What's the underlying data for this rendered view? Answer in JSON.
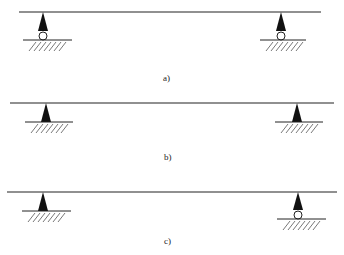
{
  "figure": {
    "panels": [
      {
        "label": "a)",
        "beam": {
          "y": 12,
          "x1": 19,
          "x2": 321
        },
        "supports": [
          {
            "type": "roller",
            "x": 43,
            "ground_y": 40,
            "ground_x1": 23,
            "ground_x2": 72
          },
          {
            "type": "roller",
            "x": 281,
            "ground_y": 40,
            "ground_x1": 260,
            "ground_x2": 306
          }
        ],
        "label_pos": {
          "x": 163,
          "y": 73
        }
      },
      {
        "label": "b)",
        "beam": {
          "y": 103,
          "x1": 10,
          "x2": 334
        },
        "supports": [
          {
            "type": "pin",
            "x": 46,
            "ground_y": 122,
            "ground_x1": 25,
            "ground_x2": 73
          },
          {
            "type": "pin",
            "x": 297,
            "ground_y": 122,
            "ground_x1": 275,
            "ground_x2": 323
          }
        ],
        "label_pos": {
          "x": 164,
          "y": 152
        }
      },
      {
        "label": "c)",
        "beam": {
          "y": 192,
          "x1": 7,
          "x2": 337
        },
        "supports": [
          {
            "type": "pin",
            "x": 43,
            "ground_y": 211,
            "ground_x1": 22,
            "ground_x2": 71
          },
          {
            "type": "roller",
            "x": 298,
            "ground_y": 219,
            "ground_x1": 277,
            "ground_x2": 326
          }
        ],
        "label_pos": {
          "x": 164,
          "y": 236
        }
      }
    ],
    "colors": {
      "stroke": "#222222",
      "fill": "#111111",
      "hatch": "#555555"
    }
  }
}
